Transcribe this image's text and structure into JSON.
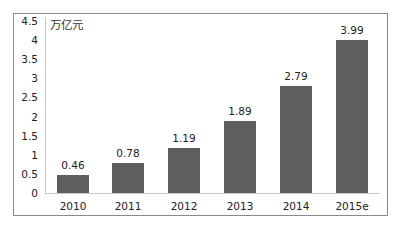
{
  "chart": {
    "unit_label": "万亿元",
    "y_ticks": [
      "4.5",
      "4",
      "3.5",
      "3",
      "2.5",
      "2",
      "1.5",
      "1",
      "0.5",
      "0"
    ]
  },
  "chart_data": {
    "type": "bar",
    "title": "",
    "xlabel": "",
    "ylabel": "万亿元",
    "categories": [
      "2010",
      "2011",
      "2012",
      "2013",
      "2014",
      "2015e"
    ],
    "values": [
      0.46,
      0.78,
      1.19,
      1.89,
      2.79,
      3.99
    ],
    "data_labels": [
      "0.46",
      "0.78",
      "1.19",
      "1.89",
      "2.79",
      "3.99"
    ],
    "ylim": [
      0,
      4.5
    ],
    "y_ticks": [
      0,
      0.5,
      1,
      1.5,
      2,
      2.5,
      3,
      3.5,
      4,
      4.5
    ],
    "grid": false,
    "legend": null,
    "bar_color": "#5e5e5e"
  }
}
